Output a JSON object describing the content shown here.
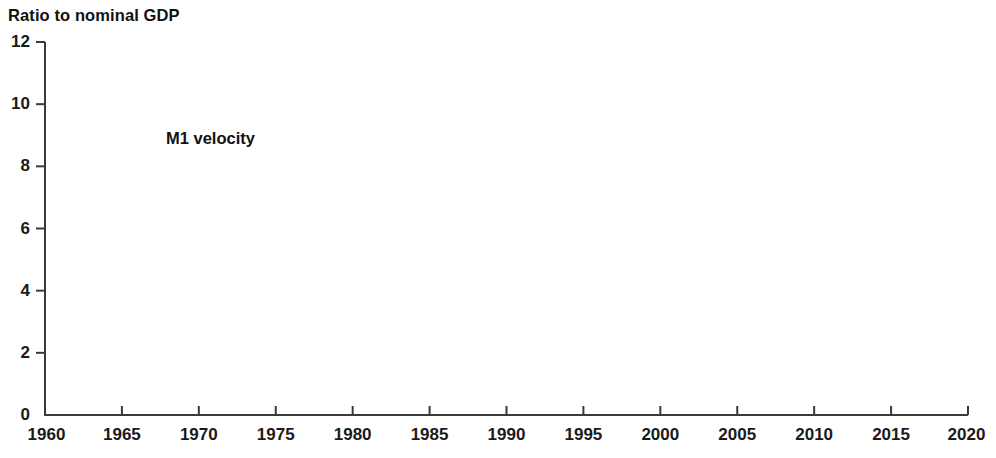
{
  "chart_data": {
    "type": "line",
    "title": "Ratio to nominal GDP",
    "xlabel": "",
    "ylabel": "Ratio to nominal GDP",
    "xlim": [
      1960,
      2020
    ],
    "ylim": [
      0,
      12
    ],
    "grid": false,
    "legend_position": "inside-top-left",
    "xticks": [
      "1960",
      "1965",
      "1970",
      "1975",
      "1980",
      "1985",
      "1990",
      "1995",
      "2000",
      "2005",
      "2010",
      "2015",
      "2020"
    ],
    "yticks": [
      "0",
      "2",
      "4",
      "6",
      "8",
      "10",
      "12"
    ],
    "line_color": "#463venue",
    "series": [
      {
        "name": "M1 velocity",
        "color": "#453venue",
        "x": [
          1960,
          1961,
          1962,
          1963,
          1964,
          1965,
          1966,
          1967,
          1968,
          1969,
          1970,
          1971,
          1972,
          1973,
          1974,
          1975,
          1976,
          1977,
          1978,
          1979,
          1980,
          1981,
          1982,
          1983,
          1984,
          1985,
          1986,
          1987,
          1988,
          1989,
          1990,
          1991,
          1992,
          1993,
          1994,
          1995,
          1996,
          1997,
          1998,
          1999,
          2000,
          2001,
          2002,
          2003,
          2004,
          2005,
          2006,
          2007,
          2008,
          2009,
          2010,
          2011,
          2012,
          2013,
          2014,
          2015,
          2016,
          2017,
          2018,
          2019
        ],
        "values": [
          3.85,
          3.8,
          3.88,
          4.0,
          4.12,
          4.25,
          4.4,
          4.48,
          4.62,
          4.8,
          4.9,
          4.95,
          5.1,
          5.3,
          5.45,
          5.5,
          5.62,
          5.8,
          6.05,
          6.35,
          6.6,
          6.95,
          7.3,
          7.15,
          7.5,
          7.35,
          6.85,
          6.55,
          6.7,
          7.0,
          7.25,
          7.3,
          7.1,
          6.85,
          6.6,
          6.35,
          6.55,
          7.0,
          7.45,
          8.05,
          8.95,
          9.6,
          9.25,
          9.35,
          9.2,
          9.25,
          9.6,
          10.45,
          10.75,
          9.95,
          8.85,
          8.8,
          8.0,
          7.25,
          6.65,
          6.4,
          6.35,
          6.1,
          5.85,
          5.78
        ]
      }
    ],
    "annotations": []
  },
  "legend": {
    "items": [
      {
        "label": "M1 velocity",
        "color": "#453venue"
      }
    ]
  },
  "colors": {
    "line": "#453venue",
    "axis": "#3a3a3a",
    "text": "#111111",
    "background": "#ffffff"
  }
}
